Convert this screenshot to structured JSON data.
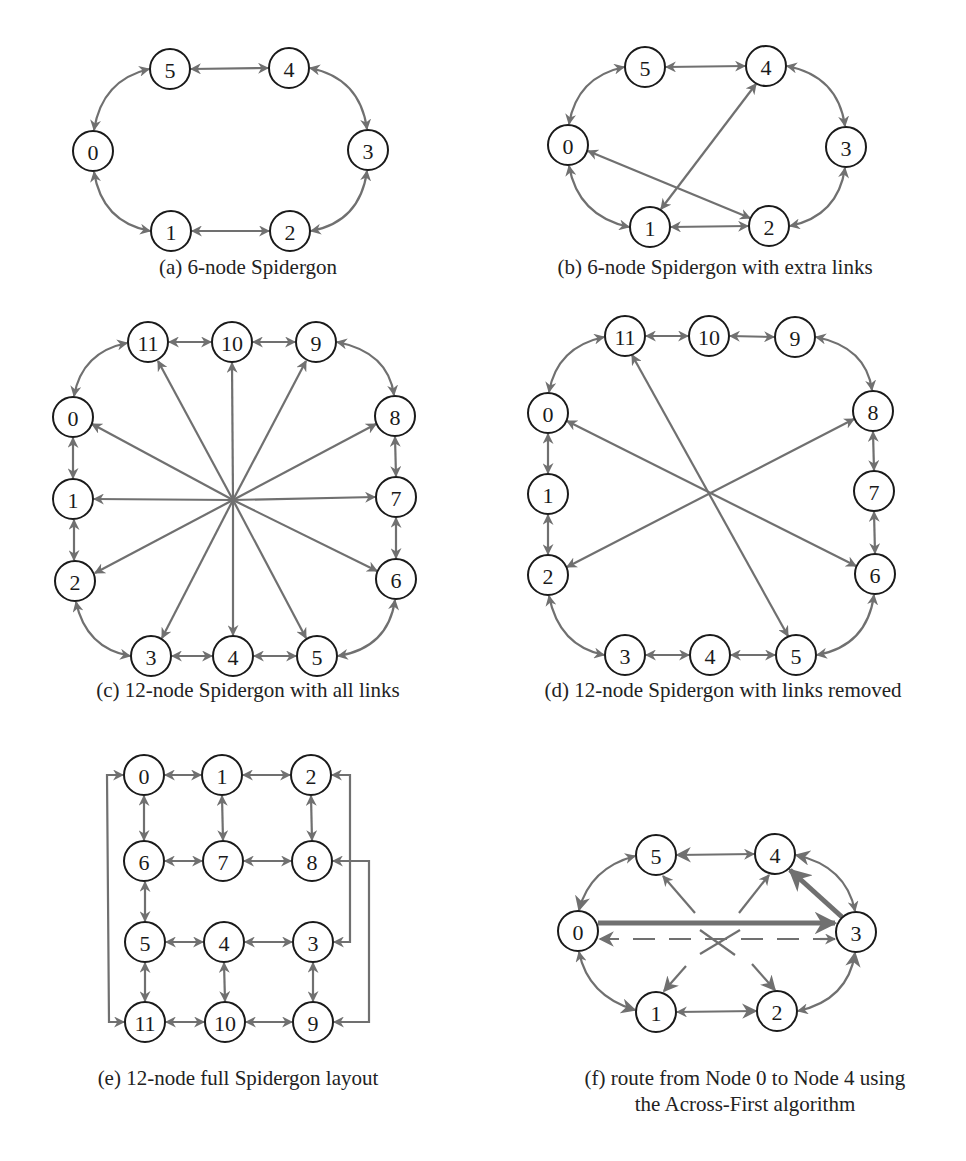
{
  "figure": {
    "panels": [
      {
        "id": "a",
        "caption": "(a) 6-node Spidergon",
        "caption_pos": {
          "x": 248,
          "y": 253
        },
        "nodes": [
          {
            "label": "0",
            "x": 93,
            "y": 151
          },
          {
            "label": "1",
            "x": 171,
            "y": 231
          },
          {
            "label": "2",
            "x": 290,
            "y": 231
          },
          {
            "label": "3",
            "x": 368,
            "y": 150
          },
          {
            "label": "4",
            "x": 289,
            "y": 68
          },
          {
            "label": "5",
            "x": 170,
            "y": 69
          }
        ],
        "edges": [
          {
            "from": "5",
            "to": "4",
            "type": "bidir"
          },
          {
            "from": "1",
            "to": "2",
            "type": "bidir"
          },
          {
            "from": "0",
            "to": "5",
            "type": "bidir",
            "curve": "arc"
          },
          {
            "from": "0",
            "to": "1",
            "type": "bidir",
            "curve": "arc"
          },
          {
            "from": "4",
            "to": "3",
            "type": "bidir",
            "curve": "arc"
          },
          {
            "from": "2",
            "to": "3",
            "type": "bidir",
            "curve": "arc"
          }
        ]
      },
      {
        "id": "b",
        "caption": "(b) 6-node Spidergon with extra links",
        "caption_pos": {
          "x": 715,
          "y": 253
        },
        "nodes": [
          {
            "label": "0",
            "x": 568,
            "y": 145
          },
          {
            "label": "1",
            "x": 650,
            "y": 227
          },
          {
            "label": "2",
            "x": 769,
            "y": 226
          },
          {
            "label": "3",
            "x": 846,
            "y": 147
          },
          {
            "label": "4",
            "x": 766,
            "y": 66
          },
          {
            "label": "5",
            "x": 645,
            "y": 67
          }
        ],
        "edges": [
          {
            "from": "5",
            "to": "4",
            "type": "bidir"
          },
          {
            "from": "1",
            "to": "2",
            "type": "bidir"
          },
          {
            "from": "0",
            "to": "5",
            "type": "bidir",
            "curve": "arc"
          },
          {
            "from": "0",
            "to": "1",
            "type": "bidir",
            "curve": "arc"
          },
          {
            "from": "4",
            "to": "3",
            "type": "bidir",
            "curve": "arc"
          },
          {
            "from": "2",
            "to": "3",
            "type": "bidir",
            "curve": "arc"
          },
          {
            "from": "0",
            "to": "2",
            "type": "bidir"
          },
          {
            "from": "1",
            "to": "4",
            "type": "bidir"
          }
        ]
      },
      {
        "id": "c",
        "caption": "(c) 12-node Spidergon with all links",
        "caption_pos": {
          "x": 248,
          "y": 676
        },
        "hub": {
          "x": 233,
          "y": 500
        },
        "nodes": [
          {
            "label": "0",
            "x": 73,
            "y": 417
          },
          {
            "label": "1",
            "x": 73,
            "y": 499
          },
          {
            "label": "2",
            "x": 75,
            "y": 581
          },
          {
            "label": "3",
            "x": 151,
            "y": 656
          },
          {
            "label": "4",
            "x": 233,
            "y": 656
          },
          {
            "label": "5",
            "x": 317,
            "y": 656
          },
          {
            "label": "6",
            "x": 396,
            "y": 579
          },
          {
            "label": "7",
            "x": 396,
            "y": 497
          },
          {
            "label": "8",
            "x": 395,
            "y": 416
          },
          {
            "label": "9",
            "x": 316,
            "y": 342
          },
          {
            "label": "10",
            "x": 232,
            "y": 342
          },
          {
            "label": "11",
            "x": 148,
            "y": 342
          }
        ],
        "ring_edges": [
          [
            "11",
            "10"
          ],
          [
            "10",
            "9"
          ],
          [
            "0",
            "1"
          ],
          [
            "1",
            "2"
          ],
          [
            "3",
            "4"
          ],
          [
            "4",
            "5"
          ],
          [
            "8",
            "7"
          ],
          [
            "7",
            "6"
          ]
        ],
        "arc_edges": [
          [
            "11",
            "0"
          ],
          [
            "9",
            "8"
          ],
          [
            "2",
            "3"
          ],
          [
            "5",
            "6"
          ]
        ],
        "hub_spokes": [
          "0",
          "1",
          "2",
          "3",
          "4",
          "5",
          "6",
          "7",
          "8",
          "9",
          "10",
          "11"
        ]
      },
      {
        "id": "d",
        "caption": "(d) 12-node Spidergon with links removed",
        "caption_pos": {
          "x": 723,
          "y": 676
        },
        "nodes": [
          {
            "label": "0",
            "x": 548,
            "y": 413
          },
          {
            "label": "1",
            "x": 548,
            "y": 494
          },
          {
            "label": "2",
            "x": 548,
            "y": 575
          },
          {
            "label": "3",
            "x": 625,
            "y": 655
          },
          {
            "label": "4",
            "x": 710,
            "y": 655
          },
          {
            "label": "5",
            "x": 796,
            "y": 655
          },
          {
            "label": "6",
            "x": 875,
            "y": 574
          },
          {
            "label": "7",
            "x": 874,
            "y": 491
          },
          {
            "label": "8",
            "x": 873,
            "y": 411
          },
          {
            "label": "9",
            "x": 795,
            "y": 337
          },
          {
            "label": "10",
            "x": 709,
            "y": 336
          },
          {
            "label": "11",
            "x": 625,
            "y": 336
          }
        ],
        "ring_edges": [
          [
            "11",
            "10"
          ],
          [
            "10",
            "9"
          ],
          [
            "0",
            "1"
          ],
          [
            "1",
            "2"
          ],
          [
            "3",
            "4"
          ],
          [
            "4",
            "5"
          ],
          [
            "8",
            "7"
          ],
          [
            "7",
            "6"
          ]
        ],
        "arc_edges": [
          [
            "11",
            "0"
          ],
          [
            "9",
            "8"
          ],
          [
            "2",
            "3"
          ],
          [
            "5",
            "6"
          ]
        ],
        "across_edges": [
          [
            "0",
            "6"
          ],
          [
            "11",
            "5"
          ],
          [
            "2",
            "8"
          ]
        ]
      },
      {
        "id": "e",
        "caption": "(e) 12-node full Spidergon layout",
        "caption_pos": {
          "x": 238,
          "y": 1065
        },
        "nodes": [
          {
            "label": "0",
            "x": 144,
            "y": 775
          },
          {
            "label": "1",
            "x": 222,
            "y": 775
          },
          {
            "label": "2",
            "x": 311,
            "y": 775
          },
          {
            "label": "6",
            "x": 144,
            "y": 861
          },
          {
            "label": "7",
            "x": 223,
            "y": 861
          },
          {
            "label": "8",
            "x": 312,
            "y": 861
          },
          {
            "label": "5",
            "x": 145,
            "y": 942
          },
          {
            "label": "4",
            "x": 224,
            "y": 942
          },
          {
            "label": "3",
            "x": 313,
            "y": 942
          },
          {
            "label": "11",
            "x": 145,
            "y": 1022
          },
          {
            "label": "10",
            "x": 225,
            "y": 1022
          },
          {
            "label": "9",
            "x": 313,
            "y": 1022
          }
        ]
      },
      {
        "id": "f",
        "caption": "(f) route from Node 0 to Node 4 using",
        "caption_line2": "the Across-First algorithm",
        "caption_pos": {
          "x": 745,
          "y": 1065
        },
        "nodes": [
          {
            "label": "0",
            "x": 578,
            "y": 931
          },
          {
            "label": "1",
            "x": 656,
            "y": 1012
          },
          {
            "label": "2",
            "x": 777,
            "y": 1011
          },
          {
            "label": "3",
            "x": 856,
            "y": 932
          },
          {
            "label": "4",
            "x": 775,
            "y": 854
          },
          {
            "label": "5",
            "x": 656,
            "y": 855
          }
        ],
        "route": {
          "source": "0",
          "destination": "4",
          "path": [
            "0",
            "3",
            "4"
          ],
          "algorithm": "Across-First"
        }
      }
    ],
    "colors": {
      "edge": "#707070",
      "node_stroke": "#1a1a1a",
      "text": "#222222",
      "background": "#ffffff"
    }
  }
}
